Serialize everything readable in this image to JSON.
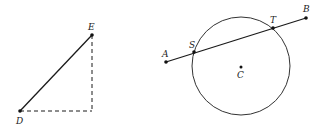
{
  "figures": {
    "right_triangle": {
      "points": {
        "D": {
          "label": "D",
          "x": 20,
          "y": 111
        },
        "E": {
          "label": "E",
          "x": 92,
          "y": 35
        }
      },
      "segment_DE": "solid",
      "legs": "dashed"
    },
    "circle_secant": {
      "circle": {
        "center_label": "C",
        "cx": 241,
        "cy": 66,
        "r": 49
      },
      "points": {
        "A": {
          "label": "A",
          "x": 166,
          "y": 62
        },
        "S": {
          "label": "S",
          "x": 194,
          "y": 52
        },
        "T": {
          "label": "T",
          "x": 273,
          "y": 28
        },
        "B": {
          "label": "B",
          "x": 306,
          "y": 18
        },
        "C": {
          "label": "C",
          "x": 241,
          "y": 66
        }
      }
    }
  },
  "colors": {
    "ink": "#1a1a1a",
    "background": "#ffffff"
  }
}
